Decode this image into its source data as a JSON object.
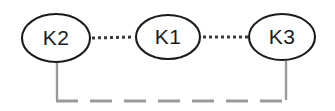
{
  "diagram": {
    "background_color": "#ffffff",
    "node_stroke_color": "#1a1a1a",
    "node_fill_color": "#ffffff",
    "label_color": "#1c1c1c",
    "dotted_link_color": "#3a3a3a",
    "bracket_color": "#9a9a9a",
    "nodes": [
      {
        "id": "k2",
        "label": "K2",
        "cx": 56,
        "cy": 38,
        "rx": 34,
        "ry": 24
      },
      {
        "id": "k1",
        "label": "K1",
        "cx": 168,
        "cy": 37,
        "rx": 32,
        "ry": 22
      },
      {
        "id": "k3",
        "label": "K3",
        "cx": 282,
        "cy": 37,
        "rx": 33,
        "ry": 23
      }
    ],
    "dotted_links": [
      {
        "id": "k2-k1",
        "from": "k2",
        "to": "k1",
        "x1": 92,
        "y1": 38,
        "x2": 134,
        "y2": 37,
        "style": "dotted"
      },
      {
        "id": "k1-k3",
        "from": "k1",
        "to": "k3",
        "x1": 202,
        "y1": 37,
        "x2": 247,
        "y2": 37,
        "style": "dotted"
      }
    ],
    "bracket": {
      "id": "k2-k3-bracket",
      "style": "dashed",
      "left_stem": {
        "x": 57,
        "y1": 62,
        "y2": 100
      },
      "right_stem": {
        "x": 286,
        "y1": 61,
        "y2": 100
      },
      "base": {
        "x1": 56,
        "x2": 287,
        "y": 101
      }
    }
  }
}
